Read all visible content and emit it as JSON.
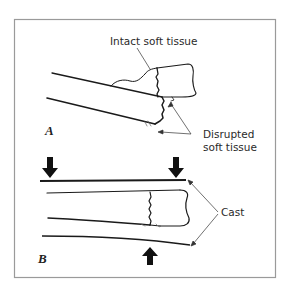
{
  "figure": {
    "panel_a": {
      "letter": "A",
      "labels": {
        "intact": "Intact soft tissue",
        "disrupted_line1": "Disrupted",
        "disrupted_line2": "soft tissue"
      }
    },
    "panel_b": {
      "letter": "B",
      "labels": {
        "cast": "Cast"
      }
    },
    "colors": {
      "stroke": "#1a1a1a",
      "frame": "#9a9a9a",
      "text": "#2a2a2a",
      "background": "#ffffff"
    }
  }
}
